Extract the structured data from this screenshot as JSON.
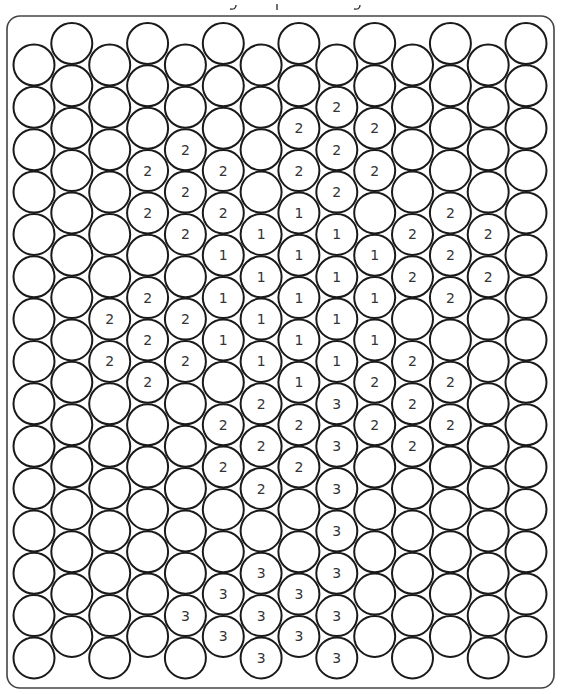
{
  "puzzle": {
    "type": "color-by-number circle grid",
    "columns_count": 14,
    "rows_count": 15,
    "legend_note": "Numbers indicate which color to fill; blank circles are background",
    "columns": [
      "...............",
      "...............",
      "......22.......",
      "...22.222......",
      "..222.22.....3.",
      "...22111.22..33",
      "....11112222333",
      "..22111112 2..33",
      ".2221111333333 3",
      "..22.1112 2.....",
      "....22.222.....",
      "....222..22....",
      "....22.........",
      "..............."
    ],
    "cells": [
      {
        "col": 2,
        "row": 6,
        "value": "2"
      },
      {
        "col": 2,
        "row": 7,
        "value": "2"
      },
      {
        "col": 3,
        "row": 3,
        "value": "2"
      },
      {
        "col": 3,
        "row": 4,
        "value": "2"
      },
      {
        "col": 3,
        "row": 6,
        "value": "2"
      },
      {
        "col": 3,
        "row": 7,
        "value": "2"
      },
      {
        "col": 3,
        "row": 8,
        "value": "2"
      },
      {
        "col": 4,
        "row": 2,
        "value": "2"
      },
      {
        "col": 4,
        "row": 3,
        "value": "2"
      },
      {
        "col": 4,
        "row": 4,
        "value": "2"
      },
      {
        "col": 4,
        "row": 6,
        "value": "2"
      },
      {
        "col": 4,
        "row": 7,
        "value": "2"
      },
      {
        "col": 4,
        "row": 13,
        "value": "3"
      },
      {
        "col": 5,
        "row": 3,
        "value": "2"
      },
      {
        "col": 5,
        "row": 4,
        "value": "2"
      },
      {
        "col": 5,
        "row": 5,
        "value": "1"
      },
      {
        "col": 5,
        "row": 6,
        "value": "1"
      },
      {
        "col": 5,
        "row": 7,
        "value": "1"
      },
      {
        "col": 5,
        "row": 9,
        "value": "2"
      },
      {
        "col": 5,
        "row": 10,
        "value": "2"
      },
      {
        "col": 5,
        "row": 13,
        "value": "3"
      },
      {
        "col": 5,
        "row": 14,
        "value": "3"
      },
      {
        "col": 6,
        "row": 4,
        "value": "1"
      },
      {
        "col": 6,
        "row": 5,
        "value": "1"
      },
      {
        "col": 6,
        "row": 6,
        "value": "1"
      },
      {
        "col": 6,
        "row": 7,
        "value": "1"
      },
      {
        "col": 6,
        "row": 8,
        "value": "2"
      },
      {
        "col": 6,
        "row": 9,
        "value": "2"
      },
      {
        "col": 6,
        "row": 10,
        "value": "2"
      },
      {
        "col": 6,
        "row": 12,
        "value": "3"
      },
      {
        "col": 6,
        "row": 13,
        "value": "3"
      },
      {
        "col": 6,
        "row": 14,
        "value": "3"
      },
      {
        "col": 7,
        "row": 2,
        "value": "2"
      },
      {
        "col": 7,
        "row": 3,
        "value": "2"
      },
      {
        "col": 7,
        "row": 4,
        "value": "1"
      },
      {
        "col": 7,
        "row": 5,
        "value": "1"
      },
      {
        "col": 7,
        "row": 6,
        "value": "1"
      },
      {
        "col": 7,
        "row": 7,
        "value": "1"
      },
      {
        "col": 7,
        "row": 8,
        "value": "1"
      },
      {
        "col": 7,
        "row": 9,
        "value": "2"
      },
      {
        "col": 7,
        "row": 10,
        "value": "2"
      },
      {
        "col": 7,
        "row": 13,
        "value": "3"
      },
      {
        "col": 7,
        "row": 14,
        "value": "3"
      },
      {
        "col": 8,
        "row": 1,
        "value": "2"
      },
      {
        "col": 8,
        "row": 2,
        "value": "2"
      },
      {
        "col": 8,
        "row": 3,
        "value": "2"
      },
      {
        "col": 8,
        "row": 4,
        "value": "1"
      },
      {
        "col": 8,
        "row": 5,
        "value": "1"
      },
      {
        "col": 8,
        "row": 6,
        "value": "1"
      },
      {
        "col": 8,
        "row": 7,
        "value": "1"
      },
      {
        "col": 8,
        "row": 8,
        "value": "3"
      },
      {
        "col": 8,
        "row": 9,
        "value": "3"
      },
      {
        "col": 8,
        "row": 10,
        "value": "3"
      },
      {
        "col": 8,
        "row": 11,
        "value": "3"
      },
      {
        "col": 8,
        "row": 12,
        "value": "3"
      },
      {
        "col": 8,
        "row": 13,
        "value": "3"
      },
      {
        "col": 8,
        "row": 14,
        "value": "3"
      },
      {
        "col": 9,
        "row": 2,
        "value": "2"
      },
      {
        "col": 9,
        "row": 3,
        "value": "2"
      },
      {
        "col": 9,
        "row": 5,
        "value": "1"
      },
      {
        "col": 9,
        "row": 6,
        "value": "1"
      },
      {
        "col": 9,
        "row": 7,
        "value": "1"
      },
      {
        "col": 9,
        "row": 8,
        "value": "2"
      },
      {
        "col": 9,
        "row": 9,
        "value": "2"
      },
      {
        "col": 10,
        "row": 4,
        "value": "2"
      },
      {
        "col": 10,
        "row": 5,
        "value": "2"
      },
      {
        "col": 10,
        "row": 7,
        "value": "2"
      },
      {
        "col": 10,
        "row": 8,
        "value": "2"
      },
      {
        "col": 10,
        "row": 9,
        "value": "2"
      },
      {
        "col": 11,
        "row": 4,
        "value": "2"
      },
      {
        "col": 11,
        "row": 5,
        "value": "2"
      },
      {
        "col": 11,
        "row": 6,
        "value": "2"
      },
      {
        "col": 11,
        "row": 8,
        "value": "2"
      },
      {
        "col": 11,
        "row": 9,
        "value": "2"
      },
      {
        "col": 12,
        "row": 4,
        "value": "2"
      },
      {
        "col": 12,
        "row": 5,
        "value": "2"
      }
    ],
    "colors": {
      "stroke": "#1a1a1a",
      "fill": "#ffffff",
      "number": "#333333",
      "frame": "#444444"
    }
  }
}
